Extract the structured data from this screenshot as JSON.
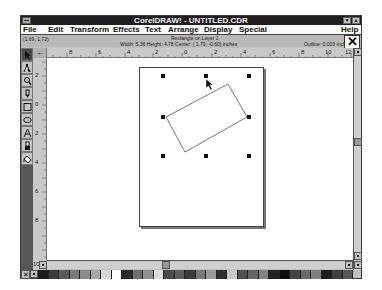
{
  "window": {
    "title": "CorelDRAW! - UNTITLED.CDR",
    "minimize_glyph": "▼",
    "maximize_glyph": "▲"
  },
  "menu": {
    "items": [
      {
        "label": "File",
        "x": 2
      },
      {
        "label": "Edit",
        "x": 27
      },
      {
        "label": "Transform",
        "x": 49
      },
      {
        "label": "Effects",
        "x": 92
      },
      {
        "label": "Text",
        "x": 124
      },
      {
        "label": "Arrange",
        "x": 147
      },
      {
        "label": "Display",
        "x": 183
      },
      {
        "label": "Special",
        "x": 218
      }
    ],
    "help": "Help"
  },
  "status": {
    "coords": "(1.69, 1.72)",
    "object": "Rectangle on Layer 1",
    "dimensions": "Width: 5.36  Height: 4.78  Center: ( 1.70, -0.60)  inches",
    "outline": "Outline:  0.003 inches"
  },
  "close_glyph": "✕",
  "rulers": {
    "corner_glyph": "-+-",
    "horizontal_labels": [
      {
        "text": "8",
        "x": 36
      },
      {
        "text": "6",
        "x": 65
      },
      {
        "text": "4",
        "x": 94
      },
      {
        "text": "2",
        "x": 122
      },
      {
        "text": "0",
        "x": 151
      },
      {
        "text": "2",
        "x": 181
      },
      {
        "text": "4",
        "x": 210
      },
      {
        "text": "6",
        "x": 239
      },
      {
        "text": "8",
        "x": 268
      },
      {
        "text": "10",
        "x": 294
      },
      {
        "text": "12",
        "x": 320
      }
    ],
    "vertical_labels": [
      {
        "text": "2",
        "y": 14
      },
      {
        "text": "0",
        "y": 43
      },
      {
        "text": "2",
        "y": 72
      },
      {
        "text": "4",
        "y": 101
      },
      {
        "text": "6",
        "y": 130
      },
      {
        "text": "8",
        "y": 159
      },
      {
        "text": "10",
        "y": 203
      }
    ]
  },
  "toolbox": {
    "tools": [
      {
        "name": "pick-tool",
        "active": true
      },
      {
        "name": "shape-tool",
        "active": false
      },
      {
        "name": "zoom-tool",
        "active": false
      },
      {
        "name": "pencil-tool",
        "active": false
      },
      {
        "name": "rectangle-tool",
        "active": false
      },
      {
        "name": "ellipse-tool",
        "active": false
      },
      {
        "name": "text-tool",
        "active": false
      },
      {
        "name": "outline-tool",
        "active": false
      },
      {
        "name": "fill-tool",
        "active": false
      }
    ]
  },
  "palette": {
    "none_glyph": "✕",
    "colors": [
      "#1a1a1a",
      "#3c3c3c",
      "#5a5a5a",
      "#7a7a7a",
      "#8c8c8c",
      "#a8a8a8",
      "#d8d8d8",
      "#ffffff",
      "#2a2a2a",
      "#6e6e6e",
      "#909090",
      "#dcdcdc",
      "#4a4a4a",
      "#5e5e5e",
      "#3a3a3a",
      "#787878",
      "#9a9a9a",
      "#2e2e2e",
      "#c8c8c8",
      "#505050",
      "#646464",
      "#828282",
      "#222222",
      "#0e0e0e",
      "#444444",
      "#6a6a6a",
      "#7e7e7e",
      "#1e1e1e",
      "#3e3e3e",
      "#565656"
    ]
  },
  "selection": {
    "handles": [
      {
        "x": 21,
        "y": 6
      },
      {
        "x": 64,
        "y": 6
      },
      {
        "x": 107,
        "y": 6
      },
      {
        "x": 21,
        "y": 74
      },
      {
        "x": 107,
        "y": 74
      },
      {
        "x": 21,
        "y": 110
      },
      {
        "x": 64,
        "y": 110
      },
      {
        "x": 107,
        "y": 110
      }
    ]
  }
}
